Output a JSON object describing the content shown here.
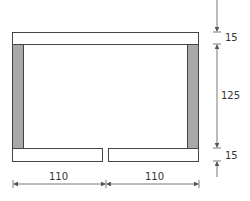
{
  "diagram": {
    "dimensions": {
      "top_thickness": "15",
      "inner_height": "125",
      "bottom_thickness": "15",
      "left_width": "110",
      "right_width": "110"
    },
    "colors": {
      "outline": "#444444",
      "post_fill": "#a9a9a9",
      "board_fill": "#ffffff",
      "dim_line": "#555555"
    }
  }
}
